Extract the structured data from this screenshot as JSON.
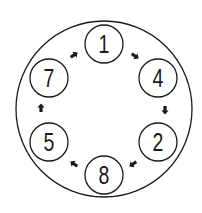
{
  "diagram": {
    "type": "circular-sequence",
    "outer_circle": {
      "cx": 104,
      "cy": 109,
      "r": 88
    },
    "nodes": [
      {
        "label": "1",
        "cx": 104,
        "cy": 44
      },
      {
        "label": "4",
        "cx": 158,
        "cy": 78
      },
      {
        "label": "2",
        "cx": 158,
        "cy": 142
      },
      {
        "label": "8",
        "cx": 104,
        "cy": 175
      },
      {
        "label": "5",
        "cx": 49,
        "cy": 142
      },
      {
        "label": "7",
        "cx": 49,
        "cy": 78
      }
    ],
    "node_radius": 19,
    "sequence": [
      "1",
      "4",
      "2",
      "8",
      "5",
      "7"
    ],
    "arrows": [
      {
        "from": "1",
        "to": "4",
        "x": 135,
        "y": 56,
        "angle": 35
      },
      {
        "from": "4",
        "to": "2",
        "x": 165,
        "y": 110,
        "angle": 90
      },
      {
        "from": "2",
        "to": "8",
        "x": 133,
        "y": 164,
        "angle": 145
      },
      {
        "from": "8",
        "to": "5",
        "x": 74,
        "y": 164,
        "angle": 215
      },
      {
        "from": "5",
        "to": "7",
        "x": 41,
        "y": 108,
        "angle": 270
      },
      {
        "from": "7",
        "to": "1",
        "x": 74,
        "y": 55,
        "angle": 325
      }
    ],
    "colors": {
      "stroke": "#1a1a1a",
      "background": "#ffffff"
    }
  }
}
